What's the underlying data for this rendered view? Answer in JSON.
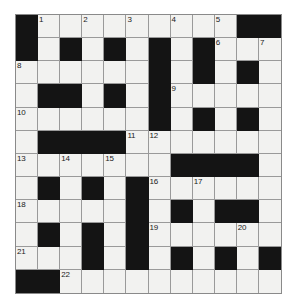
{
  "puzzle": {
    "title": "Crossword Grid",
    "rows": 12,
    "cols": 12,
    "colors": {
      "block": "#141414",
      "open": "#f2f2f0",
      "grid_line": "#9a9a9a",
      "border": "#8a8a8a",
      "number_text": "#1a1a1a",
      "page_background": "#ffffff"
    },
    "grid": [
      [
        "B",
        "O",
        "O",
        "O",
        "O",
        "O",
        "O",
        "O",
        "O",
        "O",
        "B",
        "B"
      ],
      [
        "B",
        "O",
        "B",
        "O",
        "B",
        "O",
        "B",
        "O",
        "B",
        "O",
        "O",
        "O"
      ],
      [
        "O",
        "O",
        "O",
        "O",
        "O",
        "O",
        "B",
        "O",
        "B",
        "O",
        "B",
        "O"
      ],
      [
        "O",
        "B",
        "B",
        "O",
        "B",
        "O",
        "B",
        "O",
        "O",
        "O",
        "O",
        "O"
      ],
      [
        "O",
        "O",
        "O",
        "O",
        "O",
        "O",
        "B",
        "O",
        "B",
        "O",
        "B",
        "O"
      ],
      [
        "O",
        "B",
        "B",
        "B",
        "B",
        "O",
        "O",
        "O",
        "O",
        "O",
        "O",
        "O"
      ],
      [
        "O",
        "O",
        "O",
        "O",
        "O",
        "O",
        "O",
        "B",
        "B",
        "B",
        "B",
        "O"
      ],
      [
        "O",
        "B",
        "O",
        "B",
        "O",
        "B",
        "O",
        "O",
        "O",
        "O",
        "O",
        "O"
      ],
      [
        "O",
        "O",
        "O",
        "O",
        "O",
        "B",
        "O",
        "B",
        "O",
        "B",
        "B",
        "O"
      ],
      [
        "O",
        "B",
        "O",
        "B",
        "O",
        "B",
        "O",
        "O",
        "O",
        "O",
        "O",
        "O"
      ],
      [
        "O",
        "O",
        "O",
        "B",
        "O",
        "B",
        "O",
        "B",
        "O",
        "B",
        "O",
        "B"
      ],
      [
        "B",
        "B",
        "O",
        "O",
        "O",
        "O",
        "O",
        "O",
        "O",
        "O",
        "O",
        "O"
      ]
    ],
    "numbers": [
      {
        "row": 0,
        "col": 1,
        "label": "1"
      },
      {
        "row": 0,
        "col": 3,
        "label": "2"
      },
      {
        "row": 0,
        "col": 5,
        "label": "3"
      },
      {
        "row": 0,
        "col": 7,
        "label": "4"
      },
      {
        "row": 0,
        "col": 9,
        "label": "5"
      },
      {
        "row": 1,
        "col": 9,
        "label": "6"
      },
      {
        "row": 1,
        "col": 11,
        "label": "7"
      },
      {
        "row": 2,
        "col": 0,
        "label": "8"
      },
      {
        "row": 3,
        "col": 7,
        "label": "9"
      },
      {
        "row": 4,
        "col": 0,
        "label": "10"
      },
      {
        "row": 5,
        "col": 5,
        "label": "11"
      },
      {
        "row": 5,
        "col": 6,
        "label": "12"
      },
      {
        "row": 6,
        "col": 0,
        "label": "13"
      },
      {
        "row": 6,
        "col": 2,
        "label": "14"
      },
      {
        "row": 6,
        "col": 4,
        "label": "15"
      },
      {
        "row": 7,
        "col": 6,
        "label": "16"
      },
      {
        "row": 7,
        "col": 8,
        "label": "17"
      },
      {
        "row": 8,
        "col": 0,
        "label": "18"
      },
      {
        "row": 9,
        "col": 6,
        "label": "19"
      },
      {
        "row": 9,
        "col": 10,
        "label": "20"
      },
      {
        "row": 10,
        "col": 0,
        "label": "21"
      },
      {
        "row": 11,
        "col": 2,
        "label": "22"
      }
    ]
  }
}
